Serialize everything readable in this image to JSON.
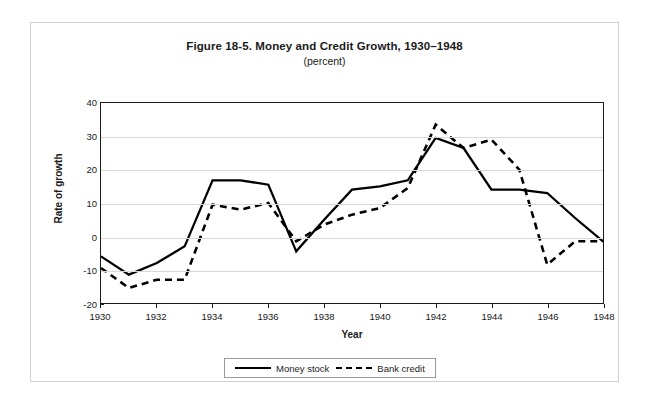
{
  "chart_data": {
    "type": "line",
    "title": "Figure 18-5. Money and Credit Growth, 1930–1948",
    "subtitle": "(percent)",
    "xlabel": "Year",
    "ylabel": "Rate of growth",
    "xlim": [
      1930,
      1948
    ],
    "ylim": [
      -20,
      40
    ],
    "ytick_labels": [
      "40",
      "30",
      "20",
      "10",
      "0",
      "-10",
      "-20"
    ],
    "ytick_values": [
      40,
      30,
      20,
      10,
      0,
      -10,
      -20
    ],
    "xtick_labels": [
      "1930",
      "1932",
      "1934",
      "1936",
      "1938",
      "1940",
      "1942",
      "1944",
      "1946",
      "1948"
    ],
    "xtick_values": [
      1930,
      1932,
      1934,
      1936,
      1938,
      1940,
      1942,
      1944,
      1946,
      1948
    ],
    "grid": true,
    "grid_axis": "y",
    "legend_position": "bottom",
    "x": [
      1930,
      1931,
      1932,
      1933,
      1934,
      1935,
      1936,
      1937,
      1938,
      1939,
      1940,
      1941,
      1942,
      1943,
      1944,
      1945,
      1946,
      1947,
      1948
    ],
    "series": [
      {
        "name": "Money stock",
        "style": "solid",
        "color": "#000000",
        "values": [
          -6,
          -11.5,
          -8,
          -3,
          16.8,
          16.8,
          15.5,
          -4.5,
          5,
          14,
          15,
          16.8,
          29.5,
          26.5,
          14,
          14,
          13,
          5.5,
          -1.5
        ]
      },
      {
        "name": "Bank credit",
        "style": "dashed",
        "color": "#000000",
        "values": [
          -9.5,
          -15.5,
          -13,
          -13,
          9.5,
          8,
          10,
          -1.5,
          3.5,
          6.5,
          8.5,
          14.5,
          33.5,
          26.5,
          29,
          20,
          -8.5,
          -1.5,
          -1.5
        ]
      }
    ]
  },
  "legend": {
    "entries": [
      {
        "label": "Money stock",
        "style": "solid"
      },
      {
        "label": "Bank credit",
        "style": "dashed"
      }
    ]
  }
}
